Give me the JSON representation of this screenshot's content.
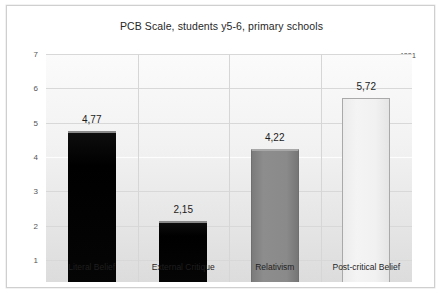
{
  "chart_data": {
    "type": "bar",
    "title": "PCB Scale, students y5-6, primary schools",
    "categories": [
      "Literal Belief",
      "External Critique",
      "Relativism",
      "Post-critical Belief"
    ],
    "values": [
      4.77,
      4.22,
      2.15,
      5.72
    ],
    "value_labels": [
      "4,77",
      "2,15",
      "4,22",
      "5,72"
    ],
    "bars": [
      {
        "category": "Literal Belief",
        "value": 4.77,
        "label": "4,77",
        "style": "fill-black",
        "color": "#000000"
      },
      {
        "category": "External Critique",
        "value": 2.15,
        "label": "2,15",
        "style": "fill-black",
        "color": "#000000"
      },
      {
        "category": "Relativism",
        "value": 4.22,
        "label": "4,22",
        "style": "fill-gray",
        "color": "#8a8a8a"
      },
      {
        "category": "Post-critical Belief",
        "value": 5.72,
        "label": "5,72",
        "style": "fill-light",
        "color": "#f1f1f1"
      }
    ],
    "xlabel": "",
    "ylabel": "",
    "ylim": [
      1,
      7
    ],
    "yticks": [
      "7",
      "6",
      "5",
      "4",
      "3",
      "2",
      "1"
    ],
    "ytick_values": [
      7,
      6,
      5,
      4,
      3,
      2,
      1
    ],
    "grid": true,
    "legend": false,
    "annotations": [
      {
        "name": "sample-size",
        "text": "n=4831"
      }
    ]
  },
  "chart": {
    "title": "PCB Scale, students y5-6, primary schools",
    "note": "n=4831"
  }
}
